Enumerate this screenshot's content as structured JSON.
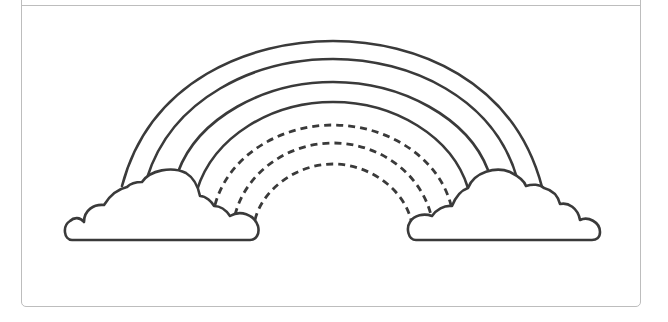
{
  "worksheet": {
    "title": "Rainbow tracing worksheet",
    "subject": "rainbow-with-clouds",
    "solid_arc_count": 4,
    "dashed_arc_count": 3,
    "cloud_count": 2,
    "stroke_color": "#3a3a3a",
    "frame_color": "#bdbdbd",
    "background_color": "#ffffff"
  }
}
